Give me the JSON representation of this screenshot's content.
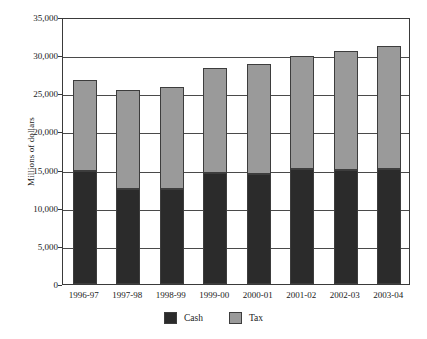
{
  "chart_data": {
    "type": "bar",
    "subtype": "stacked-vertical",
    "title": "",
    "xlabel": "",
    "ylabel": "Millions of dollars",
    "ylim": [
      0,
      35000
    ],
    "ytick_step": 5000,
    "ytick_labels": [
      "35,000",
      "30,000",
      "25,000",
      "20,000",
      "15,000",
      "10,000",
      "5,000",
      "0"
    ],
    "ytick_values": [
      35000,
      30000,
      25000,
      20000,
      15000,
      10000,
      5000,
      0
    ],
    "grid": true,
    "grid_axis": "y",
    "legend_position": "bottom-center",
    "categories": [
      "1996-97",
      "1997-98",
      "1998-99",
      "1999-00",
      "2000-01",
      "2001-02",
      "2002-03",
      "2003-04"
    ],
    "series": [
      {
        "name": "Cash",
        "color": "#2b2b2b",
        "values": [
          14800,
          12500,
          12500,
          14500,
          14400,
          15100,
          15000,
          15100
        ]
      },
      {
        "name": "Tax",
        "color": "#9a9a9a",
        "values": [
          12000,
          13000,
          13300,
          13800,
          14400,
          14800,
          15600,
          16100
        ]
      }
    ],
    "totals": [
      26800,
      25500,
      25800,
      28300,
      28800,
      29900,
      30600,
      31200
    ]
  },
  "legend": {
    "items": [
      {
        "label": "Cash",
        "color": "#2b2b2b",
        "swatch_name": "legend-swatch-cash"
      },
      {
        "label": "Tax",
        "color": "#9a9a9a",
        "swatch_name": "legend-swatch-tax"
      }
    ]
  },
  "colors": {
    "cash": "#2b2b2b",
    "tax": "#9a9a9a",
    "axis": "#3a3a3a",
    "gridline": "#4a4a4a",
    "bar_border": "#3d3d3d",
    "background": "#ffffff",
    "text": "#1a1a1a"
  }
}
